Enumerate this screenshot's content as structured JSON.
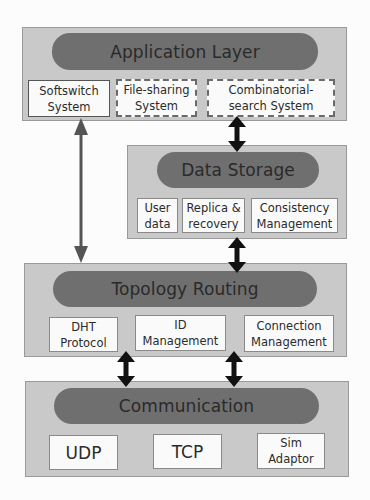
{
  "diagram": {
    "layers": {
      "application": {
        "title": "Application Layer",
        "modules": [
          {
            "label": "Softswitch\nSystem",
            "style": "solid"
          },
          {
            "label": "File-sharing\nSystem",
            "style": "dashed"
          },
          {
            "label": "Combinatorial-\nsearch System",
            "style": "dashed"
          }
        ]
      },
      "data_storage": {
        "title": "Data Storage",
        "modules": [
          {
            "label": "User\ndata"
          },
          {
            "label": "Replica &\nrecovery"
          },
          {
            "label": "Consistency\nManagement"
          }
        ]
      },
      "topology_routing": {
        "title": "Topology Routing",
        "modules": [
          {
            "label": "DHT\nProtocol"
          },
          {
            "label": "ID\nManagement"
          },
          {
            "label": "Connection\nManagement"
          }
        ]
      },
      "communication": {
        "title": "Communication",
        "modules": [
          {
            "label": "UDP"
          },
          {
            "label": "TCP"
          },
          {
            "label": "Sim\nAdaptor"
          }
        ]
      }
    },
    "connections": [
      {
        "from": "Softswitch System",
        "to": "Topology Routing",
        "type": "bidirectional",
        "color": "#555555"
      },
      {
        "from": "Combinatorial-search System",
        "to": "Data Storage",
        "type": "bidirectional",
        "color": "#111111"
      },
      {
        "from": "Data Storage",
        "to": "Topology Routing",
        "type": "bidirectional",
        "color": "#111111"
      },
      {
        "from": "DHT Protocol",
        "to": "Communication",
        "type": "bidirectional",
        "color": "#111111"
      },
      {
        "from": "ID Management",
        "to": "Communication",
        "type": "bidirectional",
        "color": "#111111"
      }
    ],
    "colors": {
      "layer_bg": "#c9c9c9",
      "pill_bg": "#6f6f6f",
      "module_bg": "#fafafa"
    }
  }
}
